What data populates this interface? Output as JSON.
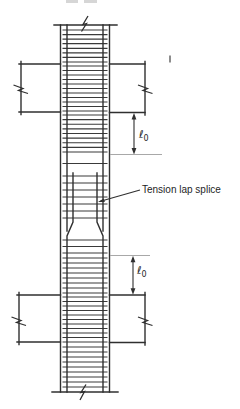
{
  "labels": {
    "tension_lap_splice": "Tension lap splice",
    "upper_lo": {
      "symbol": "ℓ",
      "subscript": "0"
    },
    "lower_lo": {
      "symbol": "ℓ",
      "subscript": "0"
    }
  },
  "colors": {
    "line": "#2f2f2f",
    "tie": "#3a3a3a",
    "reference": "#a8a8a8",
    "text": "#1e1e1e",
    "background": "#ffffff",
    "smudge": "#c4c4c4"
  },
  "figure": {
    "type": "structural-detail-diagram",
    "tie_span": [
      62.5,
      107.5
    ],
    "tie_zones": [
      {
        "name": "above-upper-joint",
        "y1": 30,
        "y2": 62,
        "count": 8
      },
      {
        "name": "upper-joint",
        "y1": 66,
        "y2": 111,
        "count": 11
      },
      {
        "name": "upper-lo-zone",
        "y1": 115,
        "y2": 152,
        "count": 9
      },
      {
        "name": "gap-above-splice",
        "y1": 163.5,
        "y2": 163.5,
        "count": 1
      },
      {
        "name": "splice-zone",
        "y1": 176,
        "y2": 218,
        "count": 7
      },
      {
        "name": "below-splice",
        "y1": 240,
        "y2": 253,
        "count": 3
      },
      {
        "name": "lower-lo-zone",
        "y1": 258,
        "y2": 293,
        "count": 8
      },
      {
        "name": "lower-joint",
        "y1": 297,
        "y2": 342,
        "count": 11
      },
      {
        "name": "below-lower-joint",
        "y1": 347,
        "y2": 387,
        "count": 9
      }
    ]
  }
}
